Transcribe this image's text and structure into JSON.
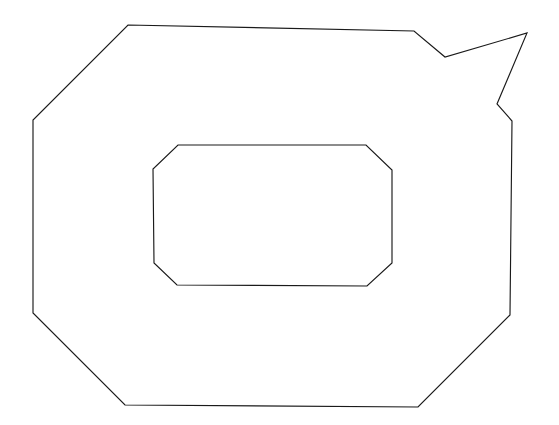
{
  "canvas": {
    "width": 559,
    "height": 425,
    "background_color": "#ffffff",
    "title": "Line Drawing"
  },
  "chart_data": {
    "type": "line",
    "title": "",
    "subtitle": "",
    "xlabel": "",
    "ylabel": "",
    "grid": false,
    "legend_position": "none",
    "xlim": [
      0,
      559
    ],
    "ylim": [
      425,
      0
    ],
    "stroke_color": "#1a1a1a",
    "stroke_width": 1.15,
    "fill": "none",
    "series": [
      {
        "name": "outer-contour",
        "closed": true,
        "points": [
          [
            128,
            25
          ],
          [
            414,
            31
          ],
          [
            445,
            57
          ],
          [
            527,
            33
          ],
          [
            497,
            104
          ],
          [
            512,
            121
          ],
          [
            510,
            315
          ],
          [
            418,
            407
          ],
          [
            125,
            405
          ],
          [
            33,
            313
          ],
          [
            33,
            120
          ]
        ]
      },
      {
        "name": "inner-contour",
        "closed": true,
        "points": [
          [
            178,
            145
          ],
          [
            366,
            145
          ],
          [
            392,
            170
          ],
          [
            392,
            263
          ],
          [
            367,
            286
          ],
          [
            177,
            285
          ],
          [
            154,
            263
          ],
          [
            153,
            169
          ]
        ]
      }
    ]
  },
  "shapes": {
    "outer": {
      "label": "outer-outline",
      "description": "Large closed polygon with chamfered corners and a pointed spike at the upper right",
      "vertex_count": 11
    },
    "inner": {
      "label": "inner-outline",
      "description": "Smaller closed octagonal rounded-rectangle polygon centered within the outer outline",
      "vertex_count": 8
    }
  }
}
